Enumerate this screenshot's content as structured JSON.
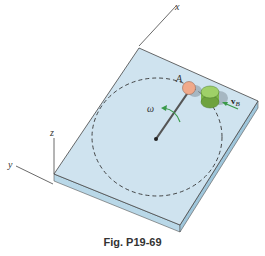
{
  "figure": {
    "caption": "Fig. P19-69",
    "axes": {
      "x_label": "x",
      "y_label": "y",
      "z_label": "z"
    },
    "labels": {
      "point_a": "A",
      "omega": "ω",
      "vb_main": "v",
      "vb_sub": "B"
    },
    "colors": {
      "plate_top": "#cfe3ef",
      "plate_side": "#a9cde0",
      "ball_a": "#f0a98a",
      "cylinder_b": "#8fc45a",
      "arrow": "#3a9a4a",
      "dashed_path": "#333333"
    }
  }
}
